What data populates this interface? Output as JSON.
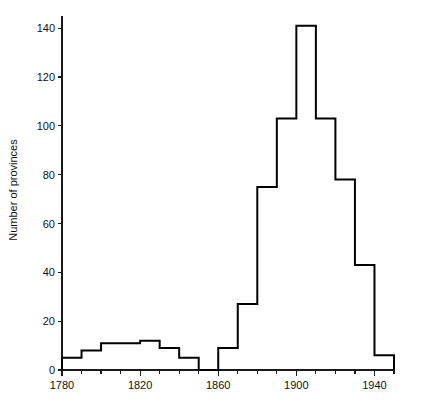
{
  "chart_data": {
    "type": "bar",
    "title": "",
    "subtitle": "",
    "xlabel": "",
    "ylabel": "Number of provinces",
    "xlim": [
      1780,
      1950
    ],
    "ylim": [
      0,
      145
    ],
    "grid": false,
    "legend": null,
    "bin_width": 5,
    "bin_starts": [
      1780,
      1785,
      1790,
      1795,
      1800,
      1805,
      1810,
      1815,
      1820,
      1825,
      1830,
      1835,
      1840,
      1845,
      1850,
      1855,
      1860,
      1865,
      1870,
      1875,
      1880,
      1885,
      1890,
      1895,
      1900,
      1905,
      1910,
      1915,
      1920,
      1925,
      1930,
      1935,
      1940,
      1945
    ],
    "categories": [
      "1780-1785",
      "1785-1790",
      "1790-1795",
      "1795-1800",
      "1800-1805",
      "1805-1810",
      "1810-1815",
      "1815-1820",
      "1820-1825",
      "1825-1830",
      "1830-1835",
      "1835-1840",
      "1840-1845",
      "1845-1850",
      "1850-1855",
      "1855-1860",
      "1860-1865",
      "1865-1870",
      "1870-1875",
      "1875-1880",
      "1880-1885",
      "1885-1890",
      "1890-1895",
      "1895-1900",
      "1900-1905",
      "1905-1910",
      "1910-1915",
      "1915-1920",
      "1920-1925",
      "1925-1930",
      "1930-1935",
      "1935-1940",
      "1940-1945",
      "1945-1950"
    ],
    "values": [
      5,
      5,
      8,
      8,
      11,
      11,
      11,
      11,
      12,
      12,
      9,
      9,
      5,
      5,
      0,
      0,
      9,
      9,
      27,
      27,
      75,
      75,
      103,
      103,
      141,
      141,
      103,
      103,
      78,
      78,
      43,
      43,
      6,
      6
    ],
    "x_ticks_major": [
      1780,
      1820,
      1860,
      1900,
      1940
    ],
    "x_tick_labels": [
      "1780",
      "1820",
      "1860",
      "1900",
      "1940"
    ],
    "x_ticks_minor_step": 10,
    "y_ticks": [
      0,
      20,
      40,
      60,
      80,
      100,
      120,
      140
    ],
    "y_tick_labels": [
      "0",
      "20",
      "40",
      "60",
      "80",
      "100",
      "120",
      "140"
    ]
  },
  "figure": {
    "background_color": "#ffffff",
    "line_color": "#000000",
    "axis_color": "#1a1a1a"
  }
}
